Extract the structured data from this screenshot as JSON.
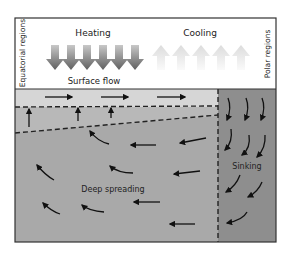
{
  "labels": {
    "left_side": "Equatorial regions",
    "right_side": "Polar regions",
    "heating": "Heating",
    "cooling": "Cooling",
    "surface_flow": "Surface flow",
    "deep_spreading": "Deep spreading",
    "sinking": "Sinking"
  },
  "colors": {
    "frame": "#333333",
    "sky": "#ffffff",
    "surface_band": "#d6d6d6",
    "upper_wedge": "#bdbdbd",
    "deep_water": "#a9a9a9",
    "polar_water": "#8e8e8e",
    "heating_arrow": "#6e6e6e",
    "cooling_arrow": "#e4e4e4",
    "flow_arrow": "#111111"
  }
}
